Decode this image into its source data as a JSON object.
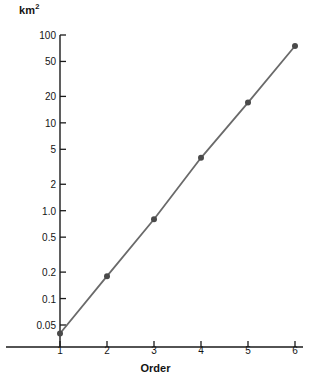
{
  "chart_data": {
    "type": "line",
    "title": "",
    "subtitle": "",
    "xlabel": "Order",
    "ylabel": "km2",
    "ylabel_display": "km",
    "ylabel_exponent": "2",
    "x": [
      1,
      2,
      3,
      4,
      5,
      6
    ],
    "values": [
      0.04,
      0.18,
      0.8,
      4.0,
      17.0,
      75.0
    ],
    "series": [
      {
        "name": "area",
        "values": [
          0.04,
          0.18,
          0.8,
          4.0,
          17.0,
          75.0
        ]
      }
    ],
    "yscale": "log",
    "xscale": "linear",
    "ylim": [
      0.032,
      115
    ],
    "xlim": [
      0.55,
      6.45
    ],
    "ytick_values": [
      0.05,
      0.1,
      0.2,
      0.5,
      1.0,
      2,
      5,
      10,
      20,
      50,
      100
    ],
    "ytick_labels": [
      "0.05",
      "0.1",
      "0.2",
      "0.5",
      "1.0",
      "2",
      "5",
      "10",
      "20",
      "50",
      "100"
    ],
    "xtick_values": [
      1,
      2,
      3,
      4,
      5,
      6
    ],
    "xtick_labels": [
      "1",
      "2",
      "3",
      "4",
      "5",
      "6"
    ],
    "grid": false,
    "legend": "none",
    "marker": "circle",
    "line_color": "#6a6a6a",
    "marker_color": "#4a4a4a",
    "axis_color": "#1a1a1a",
    "background": "#ffffff"
  }
}
